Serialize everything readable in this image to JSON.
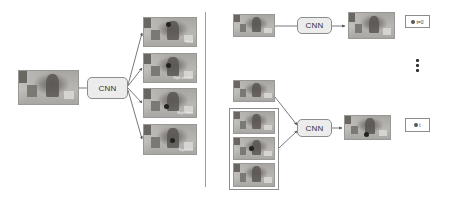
{
  "diagram": {
    "type": "two-panel CNN inference pipeline",
    "left_panel": {
      "input_frame": {
        "label": "input image (person in room)"
      },
      "model": {
        "label": "CNN"
      },
      "outputs": [
        {
          "caption": "Head"
        },
        {
          "caption": "Right shoulder"
        },
        {
          "caption": "Right elbow"
        },
        {
          "caption": "Right wrist"
        }
      ]
    },
    "right_panel": {
      "top_row": {
        "input_frame": {
          "label": "frame t=0"
        },
        "model": {
          "label": "CNN"
        },
        "output_frame": {
          "label": "prediction t=0"
        },
        "time_label": {
          "icon": "circle-icon",
          "text": "t=0"
        }
      },
      "ellipsis": "⋮",
      "bottom_row": {
        "current_frame": {
          "label": "frame t"
        },
        "previous_outputs": [
          {
            "label": "heatmap 1"
          },
          {
            "label": "heatmap 2"
          },
          {
            "label": "heatmap 3"
          }
        ],
        "model": {
          "label": "CNN"
        },
        "output_frame": {
          "label": "prediction t"
        },
        "time_label": {
          "icon": "circle-icon",
          "text": "t"
        }
      }
    },
    "colors": {
      "box_border": "#8c8c8c",
      "cnn_fill": "#ececec",
      "arrow": "#555555",
      "divider": "#9c9c9c"
    }
  }
}
